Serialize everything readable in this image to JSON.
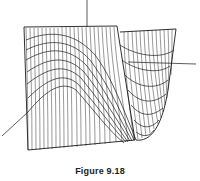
{
  "figure": {
    "caption": "Figure 9.18",
    "colors": {
      "line": "#1a1a1a",
      "background": "#ffffff",
      "axis": "#333333"
    },
    "axes": [
      {
        "name": "vertical-axis",
        "label": ""
      },
      {
        "name": "right-axis",
        "label": ""
      },
      {
        "name": "left-axis",
        "label": ""
      }
    ]
  }
}
